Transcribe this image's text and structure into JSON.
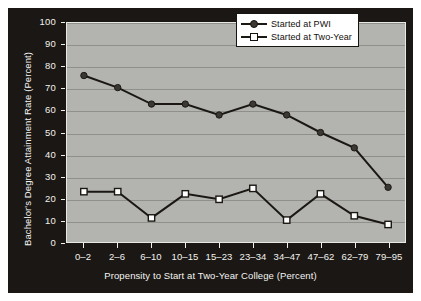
{
  "chart_data": {
    "type": "line",
    "title": "",
    "xlabel": "Propensity to Start at Two-Year College (Percent)",
    "ylabel": "Bachelor's Degree Attainment Rate (Percent)",
    "ylim": [
      0,
      100
    ],
    "ytick_labels": [
      "100",
      "90",
      "80",
      "70",
      "60",
      "50",
      "40",
      "30",
      "20",
      "10",
      "0"
    ],
    "ytick_values": [
      100,
      90,
      80,
      70,
      60,
      50,
      40,
      30,
      20,
      10,
      0
    ],
    "grid": true,
    "legend_position": "top-right",
    "categories": [
      "0–2",
      "2–6",
      "6–10",
      "10–15",
      "15–23",
      "23–34",
      "34–47",
      "47–62",
      "62–79",
      "79–95"
    ],
    "series": [
      {
        "name": "Started at PWI",
        "marker": "circle-filled",
        "color": "#3b3833",
        "values": [
          76,
          70.5,
          63,
          63,
          58,
          63,
          58,
          50,
          43,
          25
        ]
      },
      {
        "name": "Started at Two-Year",
        "marker": "square-open",
        "color": "#ffffff",
        "values": [
          23,
          23,
          11,
          22,
          19.5,
          24.5,
          10,
          22,
          12,
          8
        ]
      }
    ]
  },
  "legend": {
    "items": [
      {
        "label": "Started at PWI",
        "marker": "circle-filled"
      },
      {
        "label": "Started at Two-Year",
        "marker": "square-open"
      }
    ]
  },
  "colors": {
    "figure_background": "#ffffff",
    "frame_background": "#1a1714",
    "plot_background": "#b3b3b0",
    "gridline": "#8f8f8c",
    "axis_text": "#f2f2ef",
    "line": "#1b1813"
  }
}
